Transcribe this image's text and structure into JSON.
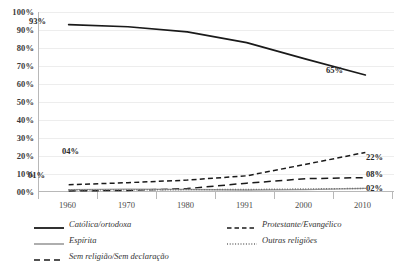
{
  "chart_data": {
    "type": "line",
    "title": "",
    "subtitle": "",
    "xlabel": "",
    "ylabel": "",
    "x": [
      "1960",
      "1970",
      "1980",
      "1991",
      "2000",
      "2010"
    ],
    "categories": [
      "1960",
      "1970",
      "1980",
      "1991",
      "2000",
      "2010"
    ],
    "ylim": [
      0,
      100
    ],
    "ytick_labels": [
      "00%",
      "10%",
      "20%",
      "30%",
      "40%",
      "50%",
      "60%",
      "70%",
      "80%",
      "90%",
      "100%"
    ],
    "ytick_values": [
      0,
      10,
      20,
      30,
      40,
      50,
      60,
      70,
      80,
      90,
      100
    ],
    "grid": true,
    "grid_axis": "y",
    "legend_position": "bottom",
    "series": [
      {
        "name": "Católica/ortodoxa",
        "style": "solid",
        "color": "#1a1a1a",
        "width": 1.6,
        "values": [
          93,
          91.8,
          89,
          83,
          73.8,
          65
        ]
      },
      {
        "name": "Protestante/Evangélico",
        "style": "dashed",
        "color": "#1a1a1a",
        "width": 1.4,
        "values": [
          4,
          5.2,
          6.6,
          9,
          15.4,
          22
        ]
      },
      {
        "name": "Espírita",
        "style": "solid",
        "color": "#9a9a9a",
        "width": 1.3,
        "values": [
          1.3,
          1.6,
          1.4,
          1.1,
          1.3,
          2
        ]
      },
      {
        "name": "Outras religiões",
        "style": "dotted",
        "color": "#6e6e6e",
        "width": 1.3,
        "values": [
          1.1,
          1.2,
          1.3,
          1.4,
          1.7,
          2
        ]
      },
      {
        "name": "Sem religião/Sem declaração",
        "style": "dashed-long",
        "color": "#1a1a1a",
        "width": 1.4,
        "values": [
          0.6,
          0.9,
          1.9,
          4.9,
          7.4,
          8
        ]
      }
    ],
    "point_labels": [
      {
        "text": "93%",
        "series": "Católica/ortodoxa",
        "x": "1960",
        "value": 93
      },
      {
        "text": "65%",
        "series": "Católica/ortodoxa",
        "x": "2010",
        "value": 65
      },
      {
        "text": "04%",
        "series": "Protestante/Evangélico",
        "x": "1960",
        "value": 4
      },
      {
        "text": "22%",
        "series": "Protestante/Evangélico",
        "x": "2010",
        "value": 22
      },
      {
        "text": "01%",
        "series": "Sem religião/Sem declaração",
        "x": "1960",
        "value": 1
      },
      {
        "text": "08%",
        "series": "Sem religião/Sem declaração",
        "x": "2010",
        "value": 8
      },
      {
        "text": "02%",
        "series": "Outras religiões",
        "x": "2010",
        "value": 2
      }
    ]
  },
  "axes": {
    "y_ticks": [
      {
        "label": "100%"
      },
      {
        "label": "90%"
      },
      {
        "label": "80%"
      },
      {
        "label": "70%"
      },
      {
        "label": "60%"
      },
      {
        "label": "50%"
      },
      {
        "label": "40%"
      },
      {
        "label": "30%"
      },
      {
        "label": "20%"
      },
      {
        "label": "10%"
      },
      {
        "label": "00%"
      }
    ],
    "x_ticks": [
      {
        "label": "1960"
      },
      {
        "label": "1970"
      },
      {
        "label": "1980"
      },
      {
        "label": "1991"
      },
      {
        "label": "2000"
      },
      {
        "label": "2010"
      }
    ]
  },
  "legend": {
    "items": [
      {
        "label": "Católica/ortodoxa",
        "style": "solid",
        "color": "#1a1a1a"
      },
      {
        "label": "Protestante/Evangélico",
        "style": "dashed",
        "color": "#1a1a1a"
      },
      {
        "label": "Espírita",
        "style": "solid",
        "color": "#9a9a9a"
      },
      {
        "label": "Outras religiões",
        "style": "dotted",
        "color": "#6e6e6e"
      },
      {
        "label": "Sem religião/Sem declaração",
        "style": "dashed-long",
        "color": "#1a1a1a"
      }
    ]
  },
  "point_label_texts": {
    "cat_start": "93%",
    "cat_end": "65%",
    "prot_start": "04%",
    "prot_end": "22%",
    "semrel_start": "01%",
    "semrel_end": "08%",
    "outras_end": "02%"
  }
}
